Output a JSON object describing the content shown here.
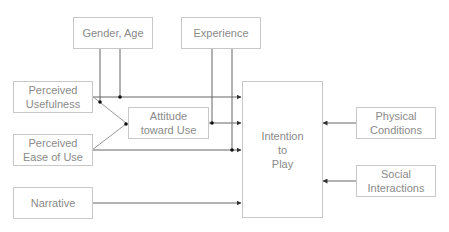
{
  "diagram": {
    "nodes": {
      "gender_age": {
        "label": "Gender, Age"
      },
      "experience": {
        "label": "Experience"
      },
      "perceived_usefulness": {
        "line1": "Perceived",
        "line2": "Usefulness"
      },
      "perceived_ease_of_use": {
        "line1": "Perceived",
        "line2": "Ease of Use"
      },
      "attitude_toward_use": {
        "line1": "Attitude",
        "line2": "toward Use"
      },
      "narrative": {
        "label": "Narrative"
      },
      "intention_to_play": {
        "line1": "Intention",
        "line2": "to",
        "line3": "Play"
      },
      "physical_conditions": {
        "line1": "Physical",
        "line2": "Conditions"
      },
      "social_interactions": {
        "line1": "Social",
        "line2": "Interactions"
      }
    },
    "edges": [
      {
        "from": "Perceived Usefulness",
        "to": "Attitude toward Use"
      },
      {
        "from": "Perceived Ease of Use",
        "to": "Attitude toward Use"
      },
      {
        "from": "Perceived Usefulness",
        "to": "Intention to Play"
      },
      {
        "from": "Attitude toward Use",
        "to": "Intention to Play"
      },
      {
        "from": "Perceived Ease of Use",
        "to": "Intention to Play"
      },
      {
        "from": "Narrative",
        "to": "Intention to Play"
      },
      {
        "from": "Physical Conditions",
        "to": "Intention to Play"
      },
      {
        "from": "Social Interactions",
        "to": "Intention to Play"
      },
      {
        "from": "Gender, Age",
        "to": "moderates PU links",
        "type": "moderator"
      },
      {
        "from": "Experience",
        "to": "moderates links to Intention",
        "type": "moderator"
      }
    ],
    "colors": {
      "border": "#c8c8c8",
      "text": "#8a8a8a",
      "line": "#555555"
    }
  }
}
